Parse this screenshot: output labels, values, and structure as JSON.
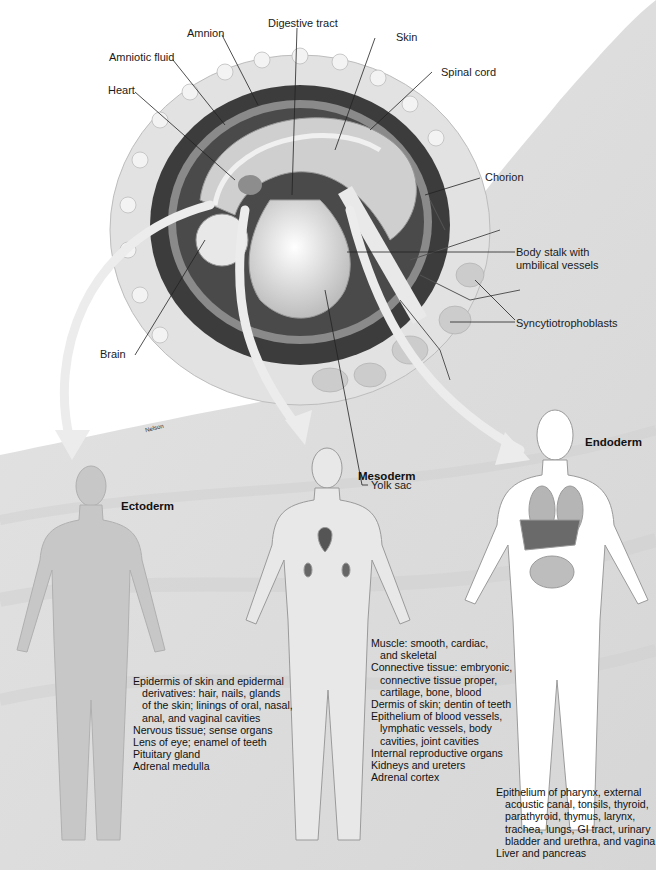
{
  "figure": {
    "signature": "Nelson",
    "page_fragment": "28 2"
  },
  "embryo_labels": [
    {
      "id": "amnion",
      "text": "Amnion"
    },
    {
      "id": "digestive-tract",
      "text": "Digestive tract"
    },
    {
      "id": "amniotic-fluid",
      "text": "Amniotic fluid"
    },
    {
      "id": "skin",
      "text": "Skin"
    },
    {
      "id": "heart",
      "text": "Heart"
    },
    {
      "id": "spinal-cord",
      "text": "Spinal cord"
    },
    {
      "id": "chorion",
      "text": "Chorion"
    },
    {
      "id": "body-stalk",
      "text": "Body stalk with",
      "text2": "umbilical vessels"
    },
    {
      "id": "syncytiotrophoblasts",
      "text": "Syncytiotrophoblasts"
    },
    {
      "id": "brain",
      "text": "Brain"
    },
    {
      "id": "yolk-sac",
      "text": "Yolk sac"
    }
  ],
  "germ_layers": {
    "ectoderm": {
      "title": "Ectoderm",
      "items": [
        {
          "text": "Epidermis of skin and epidermal",
          "indent": false
        },
        {
          "text": "derivatives: hair, nails, glands",
          "indent": true
        },
        {
          "text": "of the skin; linings of oral, nasal,",
          "indent": true
        },
        {
          "text": "anal, and vaginal cavities",
          "indent": true
        },
        {
          "text": "Nervous tissue; sense organs",
          "indent": false
        },
        {
          "text": "Lens of eye; enamel of teeth",
          "indent": false
        },
        {
          "text": "Pituitary gland",
          "indent": false
        },
        {
          "text": "Adrenal medulla",
          "indent": false
        }
      ]
    },
    "mesoderm": {
      "title": "Mesoderm",
      "items": [
        {
          "text": "Muscle: smooth, cardiac,",
          "indent": false
        },
        {
          "text": "and skeletal",
          "indent": true
        },
        {
          "text": "Connective tissue: embryonic,",
          "indent": false
        },
        {
          "text": "connective tissue proper,",
          "indent": true
        },
        {
          "text": "cartilage, bone, blood",
          "indent": true
        },
        {
          "text": "Dermis of skin; dentin of teeth",
          "indent": false
        },
        {
          "text": "Epithelium of blood vessels,",
          "indent": false
        },
        {
          "text": "lymphatic vessels, body",
          "indent": true
        },
        {
          "text": "cavities, joint cavities",
          "indent": true
        },
        {
          "text": "Internal reproductive organs",
          "indent": false
        },
        {
          "text": "Kidneys and ureters",
          "indent": false
        },
        {
          "text": "Adrenal cortex",
          "indent": false
        }
      ]
    },
    "endoderm": {
      "title": "Endoderm",
      "items": [
        {
          "text": "Epithelium of pharynx, external",
          "indent": false
        },
        {
          "text": "acoustic canal, tonsils, thyroid,",
          "indent": true
        },
        {
          "text": "parathyroid, thymus, larynx,",
          "indent": true
        },
        {
          "text": "trachea, lungs, GI tract, urinary",
          "indent": true
        },
        {
          "text": "bladder and urethra, and vagina",
          "indent": true
        },
        {
          "text": "Liver and pancreas",
          "indent": false
        }
      ]
    }
  },
  "colors": {
    "background": "#ffffff",
    "tissue": "#dcdcdc",
    "chorion_ring": "#e6e6e6",
    "dark_cavity": "#3a3a3a",
    "body_fill": "#c9c9c9",
    "arrow": "#ebebeb"
  }
}
